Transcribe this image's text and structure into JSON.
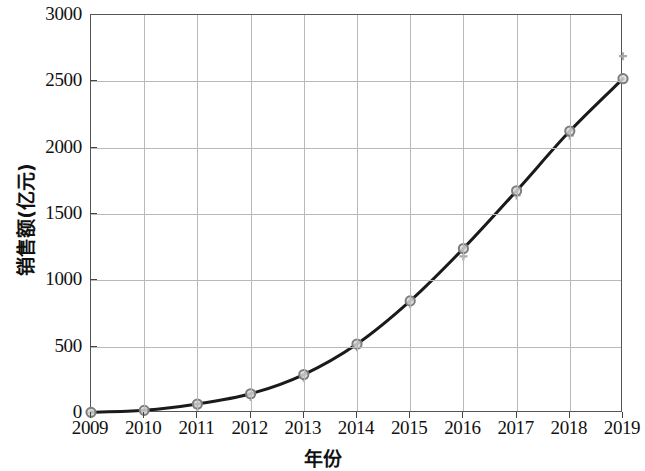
{
  "chart_data": {
    "type": "line",
    "title": "",
    "xlabel": "年份",
    "ylabel": "销售额(亿元)",
    "categories": [
      "2009",
      "2010",
      "2011",
      "2012",
      "2013",
      "2014",
      "2015",
      "2016",
      "2017",
      "2018",
      "2019"
    ],
    "x": [
      2009,
      2010,
      2011,
      2012,
      2013,
      2014,
      2015,
      2016,
      2017,
      2018,
      2019
    ],
    "series": [
      {
        "name": "销售额(亿元)",
        "values": [
          5,
          20,
          68,
          145,
          290,
          520,
          845,
          1240,
          1675,
          2125,
          2520
        ],
        "marker": "circle",
        "line_color": "#1a1a1a",
        "marker_color": "#7d7d7d"
      }
    ],
    "error_marks": {
      "note": "faint secondary tick marks slightly offset from each data point",
      "values": [
        0,
        10,
        45,
        120,
        265,
        495,
        820,
        1180,
        1640,
        2090,
        2690
      ],
      "color": "#aaaaaa"
    },
    "ylim": [
      0,
      3000
    ],
    "yticks": [
      0,
      500,
      1000,
      1500,
      2000,
      2500,
      3000
    ],
    "ytick_labels": [
      "0",
      "500",
      "1000",
      "1500",
      "2000",
      "2500",
      "3000"
    ],
    "xlim": [
      2009,
      2019
    ],
    "xticks": [
      2009,
      2010,
      2011,
      2012,
      2013,
      2014,
      2015,
      2016,
      2017,
      2018,
      2019
    ],
    "grid": true,
    "grid_color": "#b9b9b9",
    "legend": null,
    "legend_position": "none",
    "axis_color": "#555555",
    "background": "#ffffff"
  }
}
